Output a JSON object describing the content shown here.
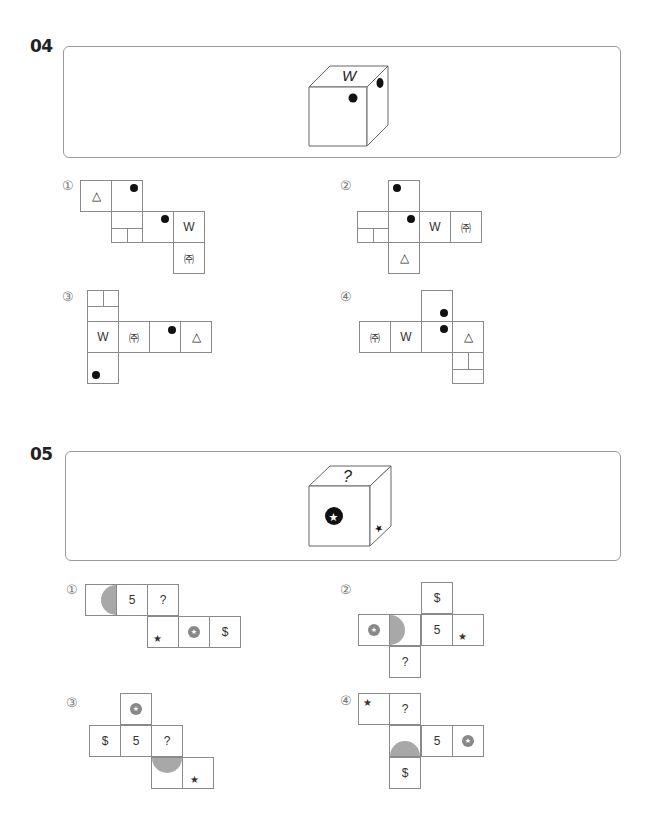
{
  "questions": [
    {
      "number": "04",
      "cube": {
        "top": "W",
        "front": "dot",
        "side": "dot"
      },
      "options": [
        {
          "label": "①"
        },
        {
          "label": "②"
        },
        {
          "label": "③"
        },
        {
          "label": "④"
        }
      ],
      "symbols": {
        "triangle": "△",
        "w": "W",
        "ju": "㈜"
      }
    },
    {
      "number": "05",
      "cube": {
        "top": "?",
        "front": "star-in-black-circle",
        "side": "star-partial"
      },
      "options": [
        {
          "label": "①"
        },
        {
          "label": "②"
        },
        {
          "label": "③"
        },
        {
          "label": "④"
        }
      ],
      "symbols": {
        "five": "5",
        "question": "?",
        "dollar": "$",
        "star": "★"
      }
    }
  ]
}
